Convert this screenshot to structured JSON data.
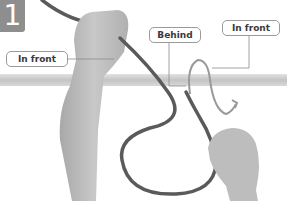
{
  "step": {
    "number": "1",
    "badge_color": "#8e8e8e"
  },
  "labels": {
    "in_front_left": "In front",
    "behind": "Behind",
    "in_front_right": "In front"
  },
  "colors": {
    "bar": "#c9c9c9",
    "rope": "#5a5a5a",
    "rope_ghost": "#9a9a9a",
    "skin": "#bdbdbd",
    "leader_line": "#8a8a8a"
  }
}
